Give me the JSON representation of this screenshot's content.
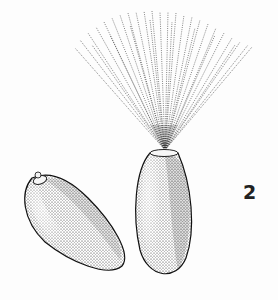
{
  "figure": {
    "label": "2",
    "colors": {
      "ink": "#1e1e1e",
      "paper": "#fdfdfd"
    }
  }
}
